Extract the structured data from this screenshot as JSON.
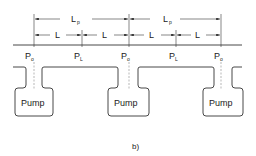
{
  "diagram": {
    "caption": "b)",
    "dimensions": {
      "period_label": "L",
      "period_subscript": "p",
      "segment_label": "L"
    },
    "pressure_points": [
      {
        "label": "P",
        "subscript": "o"
      },
      {
        "label": "P",
        "subscript": "L"
      },
      {
        "label": "P",
        "subscript": "o"
      },
      {
        "label": "P",
        "subscript": "L"
      },
      {
        "label": "P",
        "subscript": "o"
      }
    ],
    "pumps": [
      {
        "label": "Pump"
      },
      {
        "label": "Pump"
      },
      {
        "label": "Pump"
      }
    ],
    "colors": {
      "line": "#333333",
      "background": "#ffffff"
    }
  }
}
